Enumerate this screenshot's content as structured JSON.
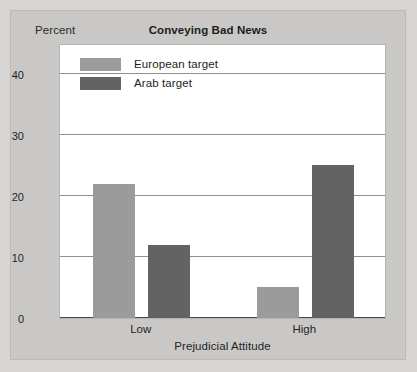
{
  "figure": {
    "background_color": "#c9c8c6",
    "page_background_color": "#d6d5d3",
    "plot_background_color": "#ffffff"
  },
  "chart_data": {
    "type": "bar",
    "title": "Conveying Bad News",
    "xlabel": "Prejudicial Attitude",
    "ylabel": "Percent",
    "categories": [
      "Low",
      "High"
    ],
    "series": [
      {
        "name": "European target",
        "values": [
          22,
          5
        ],
        "color": "#9b9b9b"
      },
      {
        "name": "Arab target",
        "values": [
          12,
          25
        ],
        "color": "#636363"
      }
    ],
    "ylim": [
      0,
      45
    ],
    "yticks": [
      0,
      10,
      20,
      30,
      40
    ],
    "ytick_labels": [
      "0",
      "10",
      "20",
      "30",
      "40"
    ],
    "grid": true,
    "grid_axis": "y",
    "legend_position": "upper left",
    "bar_group_mode": "grouped"
  }
}
